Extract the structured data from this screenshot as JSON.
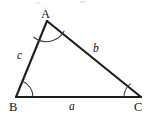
{
  "figure": {
    "kind": "triangle-diagram",
    "background_color": "#ffffff",
    "line_color": "#1c1c1c",
    "arc_color": "#3a3a3a",
    "text_color": "#141414",
    "width": 149,
    "height": 120
  },
  "vertices": [
    {
      "label": "A",
      "x": 47,
      "y": 21,
      "label_x": 41,
      "label_y": 8
    },
    {
      "label": "B",
      "x": 16,
      "y": 97,
      "label_x": 9,
      "label_y": 101
    },
    {
      "label": "C",
      "x": 141,
      "y": 97,
      "label_x": 134,
      "label_y": 101
    }
  ],
  "sides": [
    {
      "label": "a",
      "from": "B",
      "to": "C",
      "label_x": 69,
      "label_y": 101
    },
    {
      "label": "b",
      "from": "A",
      "to": "C",
      "label_x": 93,
      "label_y": 43
    },
    {
      "label": "c",
      "from": "A",
      "to": "B",
      "label_x": 17,
      "label_y": 50
    }
  ],
  "angles": [
    {
      "at": "A",
      "arc_path": "M 33.6 37.0 A 20 20 0 0 0 64.3 30.8"
    },
    {
      "at": "B",
      "arc_path": "M 22.5 81.2 A 17 17 0 0 1 33.0 97.0"
    },
    {
      "at": "C",
      "arc_path": "M 124.0 97.0 A 17 17 0 0 1 130.6 83.7"
    }
  ],
  "artifacts": {
    "note": "faint gray specks along the cropped top edge",
    "specks": [
      {
        "x": 36,
        "y": 2,
        "w": 4,
        "h": 2
      },
      {
        "x": 80,
        "y": 1,
        "w": 6,
        "h": 2
      },
      {
        "x": 44,
        "y": 7,
        "w": 2,
        "h": 2
      }
    ]
  }
}
